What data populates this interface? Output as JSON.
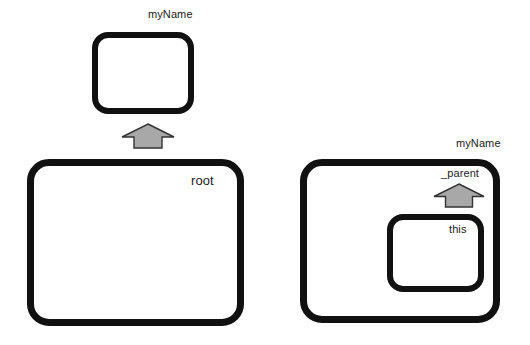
{
  "diagram": {
    "background_color": "#ffffff",
    "stroke_color": "#111111",
    "arrow_fill_color": "#a8a8a8",
    "arrow_stroke_color": "#333333",
    "nodes": [
      {
        "id": "top-clip",
        "label": "myName",
        "label_position": "above-right-outside",
        "x": 92,
        "y": 32,
        "width": 102,
        "height": 82
      },
      {
        "id": "root-clip",
        "label": "root",
        "label_position": "inside-top-right",
        "x": 27,
        "y": 159,
        "width": 217,
        "height": 167
      },
      {
        "id": "right-outer-clip",
        "label": "myName",
        "label_position": "above-right-outside",
        "x": 300,
        "y": 159,
        "width": 200,
        "height": 164
      },
      {
        "id": "right-inner-clip",
        "label": "this",
        "label_position": "inside-top-right",
        "x": 387,
        "y": 214,
        "width": 97,
        "height": 78
      }
    ],
    "arrows": [
      {
        "id": "root-arrow",
        "label": "",
        "direction": "up",
        "from": "root-clip",
        "to": "top-clip",
        "x": 120,
        "y": 122,
        "width": 56,
        "height": 28
      },
      {
        "id": "parent-arrow",
        "label": "_parent",
        "direction": "up",
        "from": "right-inner-clip",
        "to": "right-outer-clip",
        "x": 432,
        "y": 182,
        "width": 54,
        "height": 27
      }
    ]
  },
  "labels": {
    "myname_top": "myName",
    "root": "root",
    "myname_right": "myName",
    "parent": "_parent",
    "this": "this"
  }
}
